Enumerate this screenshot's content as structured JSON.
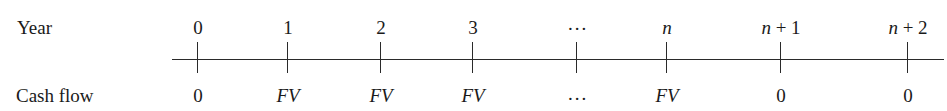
{
  "labels": {
    "year": "Year",
    "cash_flow": "Cash flow"
  },
  "timeline": [
    {
      "period": "0",
      "cash_flow": "0",
      "period_italic": false,
      "flow_italic": false,
      "x": 197
    },
    {
      "period": "1",
      "cash_flow": "FV",
      "period_italic": false,
      "flow_italic": true,
      "x": 287
    },
    {
      "period": "2",
      "cash_flow": "FV",
      "period_italic": false,
      "flow_italic": true,
      "x": 380
    },
    {
      "period": "3",
      "cash_flow": "FV",
      "period_italic": false,
      "flow_italic": true,
      "x": 472
    },
    {
      "period": "...",
      "cash_flow": "...",
      "period_italic": false,
      "flow_italic": false,
      "x": 576
    },
    {
      "period": "n",
      "cash_flow": "FV",
      "period_italic": true,
      "flow_italic": true,
      "x": 666
    },
    {
      "period": "n + 1",
      "cash_flow": "0",
      "period_italic": "mixed",
      "flow_italic": false,
      "x": 780
    },
    {
      "period": "n + 2",
      "cash_flow": "0",
      "period_italic": "mixed",
      "flow_italic": false,
      "x": 907
    }
  ],
  "colors": {
    "line": "#2a2a2a",
    "text": "#1a1a1a",
    "background": "#ffffff"
  }
}
